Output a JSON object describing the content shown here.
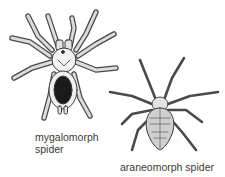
{
  "figure": {
    "subjects": [
      {
        "id": "mygalomorph",
        "label_line1": "mygalomorph",
        "label_line2": "spider",
        "icon": "mygalomorph-spider-illustration"
      },
      {
        "id": "araneomorph",
        "label": "araneomorph spider",
        "icon": "araneomorph-spider-illustration"
      }
    ],
    "colors": {
      "background": "#ffffff",
      "ink": "#3a3a3a",
      "fill_light": "#e8e8e8",
      "fill_dark": "#1a1a1a"
    }
  }
}
